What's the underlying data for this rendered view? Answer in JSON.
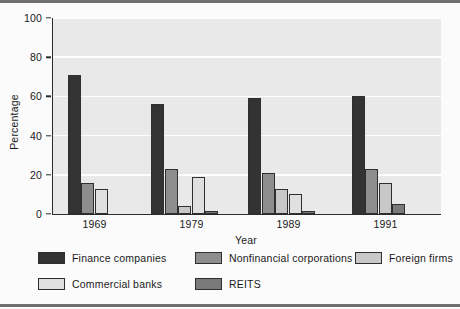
{
  "chart_data": {
    "type": "bar",
    "title": "",
    "subtitle": "",
    "xlabel": "Year",
    "ylabel": "Percentage",
    "categories": [
      "1969",
      "1979",
      "1989",
      "1991"
    ],
    "ylim": [
      0,
      100
    ],
    "yticks": [
      0,
      20,
      40,
      60,
      80,
      100
    ],
    "grid": true,
    "legend_position": "bottom",
    "series": [
      {
        "name": "Finance companies",
        "color": "#333333",
        "values": [
          71,
          56,
          59,
          60
        ]
      },
      {
        "name": "Nonfinancial corporations",
        "color": "#8e8e8e",
        "values": [
          16,
          23,
          21,
          23
        ]
      },
      {
        "name": "Foreign firms",
        "color": "#c8c8c8",
        "values": [
          0,
          4,
          13,
          16
        ]
      },
      {
        "name": "Commercial banks",
        "color": "#e0e0e0",
        "values": [
          13,
          19,
          10,
          0
        ]
      },
      {
        "name": "REITS",
        "color": "#7a7a7a",
        "values": [
          0,
          1.5,
          1.5,
          5
        ]
      }
    ]
  },
  "legend": {
    "items": [
      {
        "label": "Finance companies"
      },
      {
        "label": "Nonfinancial corporations"
      },
      {
        "label": "Foreign firms"
      },
      {
        "label": "Commercial banks"
      },
      {
        "label": "REITS"
      }
    ]
  }
}
